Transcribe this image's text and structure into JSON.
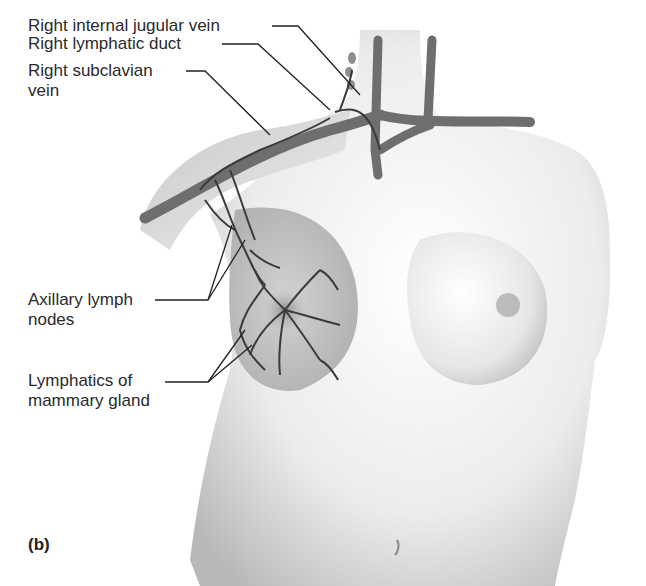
{
  "figure": {
    "panel": "(b)",
    "labels": [
      {
        "id": "right-internal-jugular-vein",
        "lines": [
          "Right internal jugular vein"
        ]
      },
      {
        "id": "right-lymphatic-duct",
        "lines": [
          "Right lymphatic duct"
        ]
      },
      {
        "id": "right-subclavian-vein",
        "lines": [
          "Right subclavian",
          "vein"
        ]
      },
      {
        "id": "axillary-lymph-nodes",
        "lines": [
          "Axillary lymph",
          "nodes"
        ]
      },
      {
        "id": "lymphatics-of-mammary-gland",
        "lines": [
          "Lymphatics of",
          "mammary gland"
        ]
      }
    ],
    "colors": {
      "skin_light": "#f2f2f2",
      "skin_shade": "#bdbdbd",
      "vein": "#6e6e6e",
      "lymph": "#3a3a3a",
      "breast_highlight": "#c9c9c9",
      "leader": "#222222"
    }
  }
}
